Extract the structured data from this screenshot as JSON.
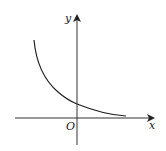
{
  "diagram": {
    "type": "function-graph",
    "labels": {
      "y_axis": "y",
      "x_axis": "x",
      "origin": "O"
    },
    "colors": {
      "stroke": "#222222",
      "axis": "#444444",
      "background": "#ffffff"
    }
  }
}
